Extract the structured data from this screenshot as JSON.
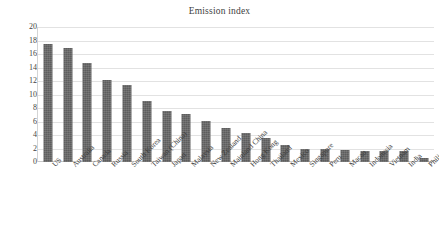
{
  "chart_data": {
    "type": "bar",
    "title": "Emission index",
    "xlabel": "",
    "ylabel": "",
    "ylim": [
      0,
      20
    ],
    "ytick_step": 2,
    "yticks": [
      20,
      18,
      16,
      14,
      12,
      10,
      8,
      6,
      4,
      2,
      0
    ],
    "grid": true,
    "legend": false,
    "bar_color": "#5d5d5d",
    "gridline_color": "#e2e2e2",
    "categories": [
      "US",
      "Australia",
      "Canada",
      "Russia",
      "South Korea",
      "Taiwan (China)",
      "Japan",
      "Malaysia",
      "New Zealand",
      "Mainland China",
      "Hong Kong",
      "Thailand",
      "Mexico",
      "Singapore",
      "Peru",
      "Macau",
      "Indonesia",
      "Vietnam",
      "India",
      "Philippines"
    ],
    "values": [
      17.5,
      16.9,
      14.6,
      12.1,
      11.4,
      9.0,
      7.6,
      7.1,
      6.1,
      5.0,
      4.3,
      3.6,
      2.5,
      1.9,
      1.9,
      1.75,
      1.7,
      1.6,
      1.6,
      0.6
    ]
  }
}
